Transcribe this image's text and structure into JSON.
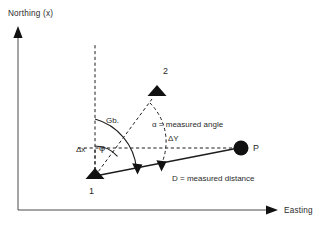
{
  "figure": {
    "background": "#ffffff",
    "ink_color": "#1d1d1d",
    "axis_color": "#4a4a4a"
  },
  "axes": {
    "y_axis_label": "Northing (x)",
    "x_axis_label": "Easting (y)",
    "origin": {
      "x": 18,
      "y": 210
    },
    "y_axis_top": {
      "x": 18,
      "y": 28
    },
    "x_axis_right": {
      "x": 272,
      "y": 210
    }
  },
  "points": [
    {
      "id": "station-1",
      "label": "1",
      "marker": "triangle",
      "x": 95,
      "y": 176,
      "label_x": 89,
      "label_y": 194
    },
    {
      "id": "station-2",
      "label": "2",
      "marker": "triangle",
      "x": 157,
      "y": 93,
      "label_x": 163,
      "label_y": 74
    },
    {
      "id": "point-p",
      "label": "P",
      "marker": "circle",
      "x": 241,
      "y": 148,
      "label_x": 253,
      "label_y": 149
    }
  ],
  "annotations": {
    "grid_bearing": {
      "symbol": "Gb.",
      "x": 106,
      "y": 123
    },
    "phi": {
      "symbol": "φ",
      "x": 102,
      "y": 148
    },
    "alpha_note": {
      "text": "α = measured angle",
      "x": 152,
      "y": 127
    },
    "distance_note": {
      "text": "D = measured distance",
      "x": 172,
      "y": 181
    },
    "delta_x": {
      "text": "Δx",
      "x": 78,
      "y": 152
    },
    "delta_y": {
      "text": "ΔY",
      "x": 168,
      "y": 140
    }
  },
  "lines": {
    "north_reference": {
      "style": "dashed",
      "from": {
        "x": 95,
        "y": 176
      },
      "to": {
        "x": 95,
        "y": 45
      }
    },
    "ray_1_to_2": {
      "style": "dashed",
      "from": {
        "x": 95,
        "y": 176
      },
      "to": {
        "x": 157,
        "y": 93
      }
    },
    "level_1_to_p": {
      "style": "dashed",
      "from": {
        "x": 80,
        "y": 148
      },
      "to": {
        "x": 232,
        "y": 148
      }
    },
    "measured_distance": {
      "style": "solid",
      "from": {
        "x": 95,
        "y": 176
      },
      "to": {
        "x": 236,
        "y": 148
      }
    }
  },
  "arcs": {
    "phi_arc": {
      "radius": 30,
      "note": "inner arc from north reference to line 1-P"
    },
    "grid_bearing_arc": {
      "radius": 57,
      "note": "outer arc from north reference to line 1-P"
    }
  }
}
